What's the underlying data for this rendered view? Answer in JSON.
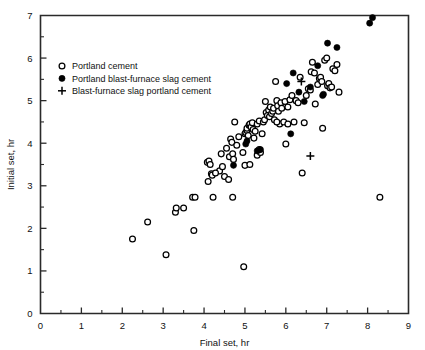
{
  "chart_data": {
    "type": "scatter",
    "title": "",
    "xlabel": "Final set, hr",
    "ylabel": "Initial set, hr",
    "xlim": [
      0,
      9
    ],
    "ylim": [
      0,
      7
    ],
    "xticks": [
      0,
      1,
      2,
      3,
      4,
      5,
      6,
      7,
      8,
      9
    ],
    "yticks": [
      0,
      1,
      2,
      3,
      4,
      5,
      6,
      7
    ],
    "xtick_labels": [
      "0",
      "1",
      "2",
      "3",
      "4",
      "5",
      "6",
      "7",
      "8",
      "9"
    ],
    "ytick_labels": [
      "0",
      "1",
      "2",
      "3",
      "4",
      "5",
      "6",
      "7"
    ],
    "minor_xticks": [
      0.5,
      1.5,
      2.5,
      3.5,
      4.5,
      5.5,
      6.5,
      7.5,
      8.5
    ],
    "minor_yticks": [
      0.5,
      1.5,
      2.5,
      3.5,
      4.5,
      5.5,
      6.5
    ],
    "grid": false,
    "legend_position": "upper-left",
    "frame": "box",
    "series": [
      {
        "name": "Portland cement",
        "marker": "open-circle",
        "color": "#000000",
        "points": [
          [
            2.25,
            1.75
          ],
          [
            2.62,
            2.15
          ],
          [
            3.07,
            1.38
          ],
          [
            3.3,
            2.38
          ],
          [
            3.32,
            2.48
          ],
          [
            3.5,
            2.48
          ],
          [
            3.72,
            2.73
          ],
          [
            3.78,
            2.73
          ],
          [
            3.75,
            1.95
          ],
          [
            4.08,
            3.55
          ],
          [
            4.12,
            3.58
          ],
          [
            4.15,
            3.5
          ],
          [
            4.18,
            3.28
          ],
          [
            4.2,
            3.25
          ],
          [
            4.1,
            3.1
          ],
          [
            4.22,
            2.73
          ],
          [
            4.38,
            3.35
          ],
          [
            4.42,
            3.75
          ],
          [
            4.5,
            3.22
          ],
          [
            4.55,
            3.88
          ],
          [
            4.6,
            3.15
          ],
          [
            4.62,
            3.68
          ],
          [
            4.65,
            4.1
          ],
          [
            4.68,
            4.02
          ],
          [
            4.7,
            3.75
          ],
          [
            4.7,
            2.73
          ],
          [
            4.72,
            3.62
          ],
          [
            4.75,
            4.5
          ],
          [
            4.8,
            3.95
          ],
          [
            4.85,
            4.15
          ],
          [
            4.97,
            1.1
          ],
          [
            4.95,
            3.78
          ],
          [
            5.0,
            4.22
          ],
          [
            5.02,
            4.25
          ],
          [
            5.05,
            4.3
          ],
          [
            5.05,
            4.35
          ],
          [
            5.08,
            4.18
          ],
          [
            5.1,
            4.42
          ],
          [
            5.12,
            4.45
          ],
          [
            5.15,
            4.38
          ],
          [
            5.0,
            3.48
          ],
          [
            5.12,
            3.5
          ],
          [
            5.18,
            4.48
          ],
          [
            5.2,
            4.32
          ],
          [
            5.25,
            4.28
          ],
          [
            5.3,
            4.45
          ],
          [
            5.35,
            4.52
          ],
          [
            5.3,
            3.72
          ],
          [
            5.38,
            3.78
          ],
          [
            5.42,
            4.22
          ],
          [
            5.45,
            4.5
          ],
          [
            5.48,
            4.55
          ],
          [
            5.5,
            4.98
          ],
          [
            5.52,
            4.72
          ],
          [
            5.55,
            4.65
          ],
          [
            5.58,
            4.78
          ],
          [
            5.6,
            4.62
          ],
          [
            5.62,
            4.85
          ],
          [
            5.65,
            4.7
          ],
          [
            5.68,
            4.75
          ],
          [
            5.7,
            4.82
          ],
          [
            5.72,
            4.55
          ],
          [
            5.75,
            5.45
          ],
          [
            5.78,
            5.0
          ],
          [
            5.8,
            4.88
          ],
          [
            5.82,
            4.75
          ],
          [
            5.85,
            4.45
          ],
          [
            5.88,
            4.95
          ],
          [
            5.9,
            4.82
          ],
          [
            5.95,
            4.5
          ],
          [
            5.98,
            4.98
          ],
          [
            6.0,
            3.98
          ],
          [
            6.05,
            4.85
          ],
          [
            6.1,
            5.02
          ],
          [
            6.15,
            5.12
          ],
          [
            6.2,
            4.5
          ],
          [
            6.25,
            5.0
          ],
          [
            6.3,
            4.95
          ],
          [
            6.35,
            5.55
          ],
          [
            6.4,
            3.3
          ],
          [
            6.45,
            4.48
          ],
          [
            6.5,
            5.12
          ],
          [
            6.55,
            5.28
          ],
          [
            6.6,
            5.25
          ],
          [
            6.62,
            5.68
          ],
          [
            6.65,
            5.9
          ],
          [
            6.7,
            5.65
          ],
          [
            6.72,
            4.92
          ],
          [
            6.78,
            5.38
          ],
          [
            6.82,
            5.52
          ],
          [
            6.85,
            5.55
          ],
          [
            6.88,
            5.45
          ],
          [
            6.9,
            4.35
          ],
          [
            6.95,
            5.95
          ],
          [
            7.0,
            6.0
          ],
          [
            7.02,
            5.35
          ],
          [
            7.05,
            5.4
          ],
          [
            7.08,
            5.3
          ],
          [
            7.12,
            5.32
          ],
          [
            7.15,
            5.75
          ],
          [
            7.2,
            5.7
          ],
          [
            7.25,
            5.85
          ],
          [
            7.3,
            5.2
          ],
          [
            8.3,
            2.73
          ],
          [
            5.22,
            4.12
          ],
          [
            4.45,
            3.45
          ],
          [
            4.28,
            3.3
          ],
          [
            6.05,
            4.45
          ],
          [
            5.35,
            3.85
          ],
          [
            5.78,
            4.5
          ]
        ]
      },
      {
        "name": "Portland blast-furnace slag cement",
        "marker": "filled-circle",
        "color": "#000000",
        "points": [
          [
            4.72,
            3.48
          ],
          [
            5.02,
            3.98
          ],
          [
            5.05,
            4.05
          ],
          [
            5.3,
            3.82
          ],
          [
            5.38,
            3.85
          ],
          [
            6.02,
            5.4
          ],
          [
            6.18,
            5.65
          ],
          [
            6.12,
            4.22
          ],
          [
            6.32,
            5.2
          ],
          [
            6.45,
            4.98
          ],
          [
            6.6,
            5.32
          ],
          [
            6.78,
            5.82
          ],
          [
            6.9,
            5.12
          ],
          [
            6.92,
            5.15
          ],
          [
            7.02,
            6.35
          ],
          [
            7.25,
            6.25
          ],
          [
            8.05,
            6.82
          ],
          [
            8.12,
            6.95
          ]
        ]
      },
      {
        "name": "Blast-furnace slag portland cement",
        "marker": "plus",
        "color": "#000000",
        "points": [
          [
            6.38,
            5.45
          ],
          [
            6.6,
            3.7
          ]
        ]
      }
    ]
  },
  "legend": {
    "entries": [
      {
        "marker": "open-circle",
        "label": "Portland cement"
      },
      {
        "marker": "filled-circle",
        "label": "Portland blast-furnace slag cement"
      },
      {
        "marker": "plus",
        "label": "Blast-furnace slag portland cement"
      }
    ]
  }
}
